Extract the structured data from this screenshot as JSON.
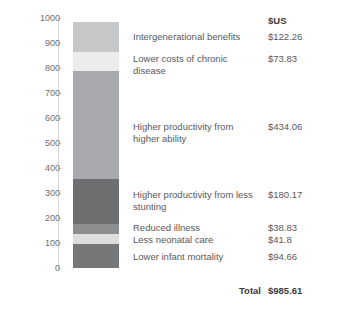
{
  "chart_data": {
    "type": "bar",
    "subtype": "stacked-single-bar",
    "title": "",
    "xlabel": "",
    "ylabel": "",
    "ylim": [
      0,
      1000
    ],
    "grid": false,
    "legend_position": "right-table",
    "value_header": "$US",
    "total_label": "Total",
    "total_value": "$985.61",
    "total_number": 985.61,
    "axis_ticks": [
      {
        "label": "1000",
        "value": 1000
      },
      {
        "label": "900",
        "value": 900
      },
      {
        "label": "800",
        "value": 800
      },
      {
        "label": "700",
        "value": 700
      },
      {
        "label": "600",
        "value": 600
      },
      {
        "label": "500",
        "value": 500
      },
      {
        "label": "400",
        "value": 400
      },
      {
        "label": "300",
        "value": 300
      },
      {
        "label": "200",
        "value": 200
      },
      {
        "label": "100",
        "value": 100
      },
      {
        "label": "0",
        "value": 0
      }
    ],
    "categories": [
      "Intergenerational benefits",
      "Lower costs of chronic disease",
      "Higher productivity from higher ability",
      "Higher productivity from less stunting",
      "Reduced illness",
      "Less neonatal care",
      "Lower infant mortality"
    ],
    "values": [
      122.26,
      73.83,
      434.06,
      180.17,
      38.83,
      41.8,
      94.66
    ],
    "value_labels": [
      "$122.26",
      "$73.83",
      "$434.06",
      "$180.17",
      "$38.83",
      "$41.8",
      "$94.66"
    ],
    "segments": [
      {
        "label": "Intergenerational benefits",
        "value": 122.26,
        "value_label": "$122.26",
        "color": "#c6c7c8",
        "cum_bottom": 863.35,
        "cum_top": 985.61
      },
      {
        "label": "Lower costs of chronic disease",
        "value": 73.83,
        "value_label": "$73.83",
        "color": "#ececec",
        "cum_bottom": 789.52,
        "cum_top": 863.35
      },
      {
        "label": "Higher productivity from higher ability",
        "value": 434.06,
        "value_label": "$434.06",
        "color": "#a7a9ac",
        "cum_bottom": 355.46,
        "cum_top": 789.52
      },
      {
        "label": "Higher productivity from less stunting",
        "value": 180.17,
        "value_label": "$180.17",
        "color": "#6d6e70",
        "cum_bottom": 175.29,
        "cum_top": 355.46
      },
      {
        "label": "Reduced illness",
        "value": 38.83,
        "value_label": "$38.83",
        "color": "#8c8d8f",
        "cum_bottom": 136.46,
        "cum_top": 175.29
      },
      {
        "label": "Less neonatal care",
        "value": 41.8,
        "value_label": "$41.8",
        "color": "#dedede",
        "cum_bottom": 94.66,
        "cum_top": 136.46
      },
      {
        "label": "Lower infant mortality",
        "value": 94.66,
        "value_label": "$94.66",
        "color": "#767779",
        "cum_bottom": 0,
        "cum_top": 94.66
      }
    ],
    "row_entries": [
      {
        "label": "Intergenerational benefits",
        "value_label": "$122.26",
        "top": 31,
        "two_line": false
      },
      {
        "label": "Lower costs of chronic disease",
        "value_label": "$73.83",
        "top": 53,
        "two_line": false
      },
      {
        "label": "Higher productivity from higher ability",
        "value_label": "$434.06",
        "top": 121,
        "two_line": true
      },
      {
        "label": "Higher productivity from less stunting",
        "value_label": "$180.17",
        "top": 189,
        "two_line": true
      },
      {
        "label": "Reduced illness",
        "value_label": "$38.83",
        "top": 222,
        "two_line": false
      },
      {
        "label": "Less neonatal care",
        "value_label": "$41.8",
        "top": 234,
        "two_line": false
      },
      {
        "label": "Lower infant mortality",
        "value_label": "$94.66",
        "top": 251,
        "two_line": false
      }
    ]
  }
}
